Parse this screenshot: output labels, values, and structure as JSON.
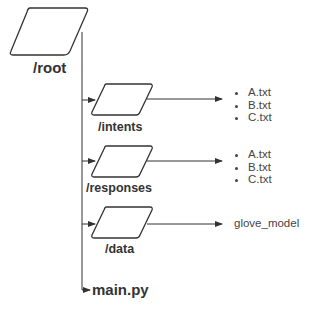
{
  "diagram": {
    "root": {
      "label": "/root"
    },
    "folders": [
      {
        "label": "/intents",
        "outputs": [
          "A.txt",
          "B.txt",
          "C.txt"
        ]
      },
      {
        "label": "/responses",
        "outputs": [
          "A.txt",
          "B.txt",
          "C.txt"
        ]
      },
      {
        "label": "/data",
        "output_text": "glove_model"
      }
    ],
    "file": {
      "label": "main.py"
    },
    "colors": {
      "stroke": "#333333",
      "text": "#333333"
    }
  }
}
